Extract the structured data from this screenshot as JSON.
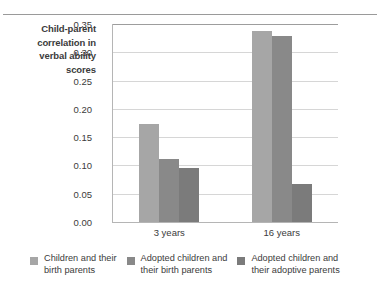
{
  "chart_data": {
    "type": "bar",
    "title": "",
    "subtitle": "",
    "xlabel": "",
    "ylabel": "Child-parent correlation in verbal ability scores",
    "categories": [
      "3 years",
      "16 years"
    ],
    "series": [
      {
        "name": "Children and their birth parents",
        "values": [
          0.173,
          0.338
        ],
        "color": "#a6a6a6"
      },
      {
        "name": "Adopted children and their birth parents",
        "values": [
          0.111,
          0.328
        ],
        "color": "#898989"
      },
      {
        "name": "Adopted children and their adoptive parents",
        "values": [
          0.096,
          0.067
        ],
        "color": "#7b7b7b"
      }
    ],
    "ylim": [
      0.0,
      0.35
    ],
    "ytick_step": 0.05,
    "yticks": [
      "0.35",
      "0.30",
      "0.25",
      "0.20",
      "0.15",
      "0.10",
      "0.05",
      "0.00"
    ],
    "ytick_values": [
      0.35,
      0.3,
      0.25,
      0.2,
      0.15,
      0.1,
      0.05,
      0.0
    ],
    "grid": "horizontal",
    "legend_position": "bottom"
  },
  "axis": {
    "y_title_lines": [
      "Child-parent",
      "correlation in",
      "verbal ability",
      "scores"
    ],
    "y_title_text": "Child-parent correlation in verbal ability scores"
  },
  "legend": {
    "items": [
      {
        "label": "Children and their\nbirth parents",
        "color": "#a6a6a6"
      },
      {
        "label": "Adopted children and\ntheir birth parents",
        "color": "#898989"
      },
      {
        "label": "Adopted children and\ntheir adoptive parents",
        "color": "#7b7b7b"
      }
    ]
  },
  "colors": {
    "series1": "#a6a6a6",
    "series2": "#898989",
    "series3": "#7b7b7b",
    "gridline": "#d6d6d6",
    "axis": "#b5b5b5",
    "rule": "#9a9a9a",
    "text": "#3b3b3b",
    "background": "#ffffff"
  }
}
